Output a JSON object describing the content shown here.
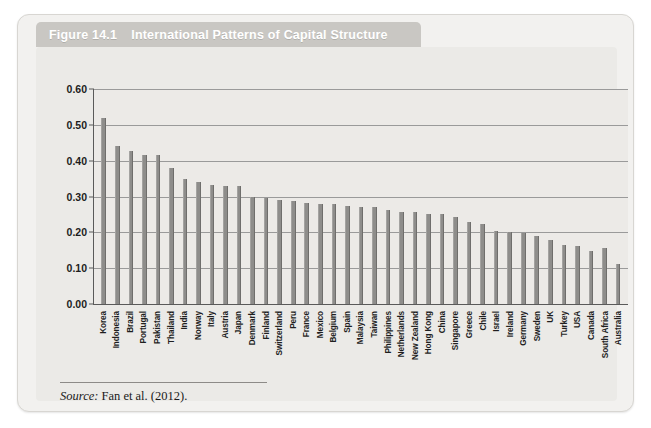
{
  "figure": {
    "number": "Figure 14.1",
    "title": "International Patterns of Capital Structure",
    "source_label": "Source:",
    "source_text": "Fan et al. (2012)."
  },
  "colors": {
    "bar": "#8e8d8b",
    "title_tab": "#c9c7c3",
    "panel": "#ebeae7",
    "card": "#f2f1ef",
    "axis": "#5a5a5a",
    "gridline": "#9a9a9a"
  },
  "chart_data": {
    "type": "bar",
    "title": "International Patterns of Capital Structure",
    "xlabel": "",
    "ylabel": "",
    "ylim": [
      0.0,
      0.6
    ],
    "yticks": [
      0.0,
      0.1,
      0.2,
      0.3,
      0.4,
      0.5,
      0.6
    ],
    "ytick_labels": [
      "0.00",
      "0.10",
      "0.20",
      "0.30",
      "0.40",
      "0.50",
      "0.60"
    ],
    "grid": true,
    "legend": null,
    "categories": [
      "Korea",
      "Indonesia",
      "Brazil",
      "Portugal",
      "Pakistan",
      "Thailand",
      "India",
      "Norway",
      "Italy",
      "Austria",
      "Japan",
      "Denmark",
      "Finland",
      "Switzerland",
      "Peru",
      "France",
      "Mexico",
      "Belgium",
      "Spain",
      "Malaysia",
      "Taiwan",
      "Philippines",
      "Netherlands",
      "New Zealand",
      "Hong Kong",
      "China",
      "Singapore",
      "Greece",
      "Chile",
      "Israel",
      "Ireland",
      "Germany",
      "Sweden",
      "UK",
      "Turkey",
      "USA",
      "Canada",
      "South Africa",
      "Australia"
    ],
    "values": [
      0.52,
      0.442,
      0.428,
      0.415,
      0.415,
      0.38,
      0.348,
      0.34,
      0.333,
      0.33,
      0.328,
      0.3,
      0.297,
      0.29,
      0.288,
      0.283,
      0.28,
      0.278,
      0.273,
      0.272,
      0.27,
      0.263,
      0.258,
      0.256,
      0.252,
      0.25,
      0.242,
      0.228,
      0.222,
      0.205,
      0.202,
      0.198,
      0.19,
      0.18,
      0.165,
      0.162,
      0.148,
      0.155,
      0.112
    ]
  }
}
